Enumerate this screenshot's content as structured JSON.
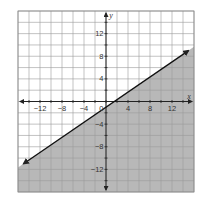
{
  "chart_data": {
    "type": "line",
    "title": "",
    "xlabel": "x",
    "ylabel": "y",
    "xlim": [
      -16,
      16
    ],
    "ylim": [
      -16,
      16
    ],
    "grid": true,
    "grid_step": 2,
    "x_ticks": [
      -12,
      -8,
      -4,
      4,
      8,
      12
    ],
    "y_ticks": [
      12,
      8,
      4,
      -4,
      -8,
      -12
    ],
    "x_tick_labels": [
      "−12",
      "−8",
      "−4",
      "4",
      "8",
      "12"
    ],
    "y_tick_labels": [
      "12",
      "8",
      "4",
      "−4",
      "−8",
      "−12"
    ],
    "origin_label": "0",
    "series": [
      {
        "name": "boundary line",
        "equation": "y = (2/3)x - 1",
        "style": "solid",
        "arrows": "both",
        "x": [
          -15,
          15
        ],
        "y": [
          -11,
          9
        ]
      }
    ],
    "shaded_region": "below line",
    "inequality": "y ≤ (2/3)x - 1",
    "colors": {
      "shade": "#b8b8b8",
      "grid": "#9a9a9a",
      "line": "#111111",
      "background": "#ffffff"
    }
  }
}
